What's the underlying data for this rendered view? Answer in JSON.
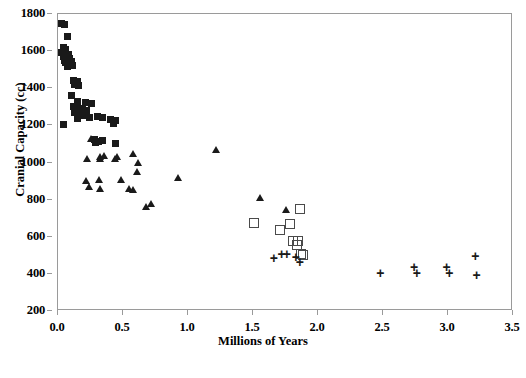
{
  "chart_data": {
    "type": "scatter",
    "title": "",
    "xlabel": "Millions of Years",
    "ylabel": "Cranial Capacity (cc)",
    "xlim": [
      0.0,
      3.5
    ],
    "ylim": [
      200,
      1800
    ],
    "xticks": [
      "0.0",
      "0.5",
      "1.0",
      "1.5",
      "2.0",
      "2.5",
      "3.0",
      "3.5"
    ],
    "xtick_values": [
      0.0,
      0.5,
      1.0,
      1.5,
      2.0,
      2.5,
      3.0,
      3.5
    ],
    "yticks": [
      "200",
      "400",
      "600",
      "800",
      "1000",
      "1200",
      "1400",
      "1600",
      "1800"
    ],
    "ytick_values": [
      200,
      400,
      600,
      800,
      1000,
      1200,
      1400,
      1600,
      1800
    ],
    "grid": false,
    "legend": "none",
    "marker_color": "#1a1a1a",
    "open_marker_color": "#4a4a4a",
    "frame_color": "#9a9a9a",
    "background": "#ffffff",
    "series": [
      {
        "name": "filled-square",
        "marker": "square",
        "filled": true,
        "points": [
          [
            0.03,
            1750
          ],
          [
            0.05,
            1745
          ],
          [
            0.07,
            1680
          ],
          [
            0.04,
            1620
          ],
          [
            0.06,
            1610
          ],
          [
            0.03,
            1595
          ],
          [
            0.05,
            1585
          ],
          [
            0.08,
            1580
          ],
          [
            0.04,
            1570
          ],
          [
            0.07,
            1565
          ],
          [
            0.09,
            1560
          ],
          [
            0.05,
            1550
          ],
          [
            0.1,
            1545
          ],
          [
            0.06,
            1540
          ],
          [
            0.08,
            1530
          ],
          [
            0.11,
            1525
          ],
          [
            0.07,
            1515
          ],
          [
            0.12,
            1440
          ],
          [
            0.15,
            1435
          ],
          [
            0.13,
            1420
          ],
          [
            0.16,
            1415
          ],
          [
            0.1,
            1360
          ],
          [
            0.15,
            1330
          ],
          [
            0.21,
            1325
          ],
          [
            0.26,
            1320
          ],
          [
            0.12,
            1300
          ],
          [
            0.14,
            1295
          ],
          [
            0.17,
            1290
          ],
          [
            0.19,
            1285
          ],
          [
            0.22,
            1280
          ],
          [
            0.13,
            1270
          ],
          [
            0.16,
            1265
          ],
          [
            0.18,
            1260
          ],
          [
            0.2,
            1255
          ],
          [
            0.3,
            1250
          ],
          [
            0.34,
            1245
          ],
          [
            0.24,
            1240
          ],
          [
            0.15,
            1235
          ],
          [
            0.4,
            1230
          ],
          [
            0.44,
            1225
          ],
          [
            0.04,
            1205
          ],
          [
            0.43,
            1210
          ],
          [
            0.28,
            1125
          ],
          [
            0.31,
            1115
          ],
          [
            0.34,
            1120
          ],
          [
            0.29,
            1110
          ],
          [
            0.44,
            1105
          ]
        ]
      },
      {
        "name": "filled-triangle",
        "marker": "triangle",
        "filled": true,
        "points": [
          [
            0.26,
            1130
          ],
          [
            0.23,
            1020
          ],
          [
            0.33,
            1020
          ],
          [
            0.44,
            1020
          ],
          [
            0.33,
            1030
          ],
          [
            0.22,
            900
          ],
          [
            0.32,
            905
          ],
          [
            0.36,
            1035
          ],
          [
            0.46,
            1030
          ],
          [
            0.58,
            1045
          ],
          [
            0.62,
            1000
          ],
          [
            0.61,
            950
          ],
          [
            0.49,
            905
          ],
          [
            0.24,
            870
          ],
          [
            0.33,
            860
          ],
          [
            0.55,
            860
          ],
          [
            0.58,
            855
          ],
          [
            0.68,
            760
          ],
          [
            0.72,
            780
          ],
          [
            0.93,
            915
          ],
          [
            1.22,
            1070
          ],
          [
            1.56,
            810
          ],
          [
            1.76,
            745
          ]
        ]
      },
      {
        "name": "open-square",
        "marker": "square",
        "filled": false,
        "points": [
          [
            1.5,
            680
          ],
          [
            1.7,
            640
          ],
          [
            1.78,
            675
          ],
          [
            1.85,
            755
          ],
          [
            1.8,
            585
          ],
          [
            1.84,
            580
          ],
          [
            1.83,
            560
          ],
          [
            1.86,
            510
          ],
          [
            1.88,
            505
          ]
        ]
      },
      {
        "name": "plus",
        "marker": "plus",
        "filled": true,
        "points": [
          [
            1.66,
            490
          ],
          [
            1.72,
            510
          ],
          [
            1.76,
            512
          ],
          [
            1.83,
            495
          ],
          [
            1.86,
            468
          ],
          [
            2.48,
            412
          ],
          [
            2.74,
            440
          ],
          [
            2.76,
            412
          ],
          [
            2.99,
            440
          ],
          [
            3.01,
            410
          ],
          [
            3.21,
            500
          ],
          [
            3.22,
            400
          ]
        ]
      }
    ]
  }
}
